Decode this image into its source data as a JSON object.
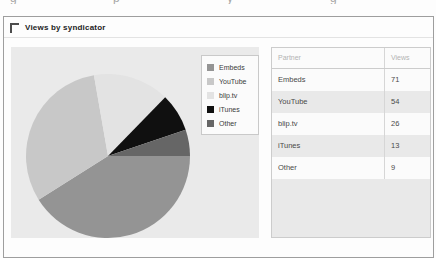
{
  "top_cropped_fragments": [
    "g",
    "p",
    "y",
    "g"
  ],
  "panel": {
    "title": "Views by syndicator"
  },
  "chart_data": {
    "type": "pie",
    "title": "Views by syndicator",
    "categories": [
      "Embeds",
      "YouTube",
      "blip.tv",
      "iTunes",
      "Other"
    ],
    "values": [
      71,
      54,
      26,
      13,
      9
    ],
    "total": 173,
    "colors": [
      "#949494",
      "#c8c8c8",
      "#e3e3e3",
      "#101010",
      "#666666"
    ],
    "start_angle_deg_clockwise_from_top": 90,
    "direction": "clockwise",
    "legend_position": "right-overlay",
    "plot_background": "#eaeaea"
  },
  "table": {
    "columns": [
      "Partner",
      "Views"
    ],
    "rows": [
      {
        "partner": "Embeds",
        "views": "71"
      },
      {
        "partner": "YouTube",
        "views": "54"
      },
      {
        "partner": "blip.tv",
        "views": "26"
      },
      {
        "partner": "iTunes",
        "views": "13"
      },
      {
        "partner": "Other",
        "views": "9"
      }
    ]
  }
}
